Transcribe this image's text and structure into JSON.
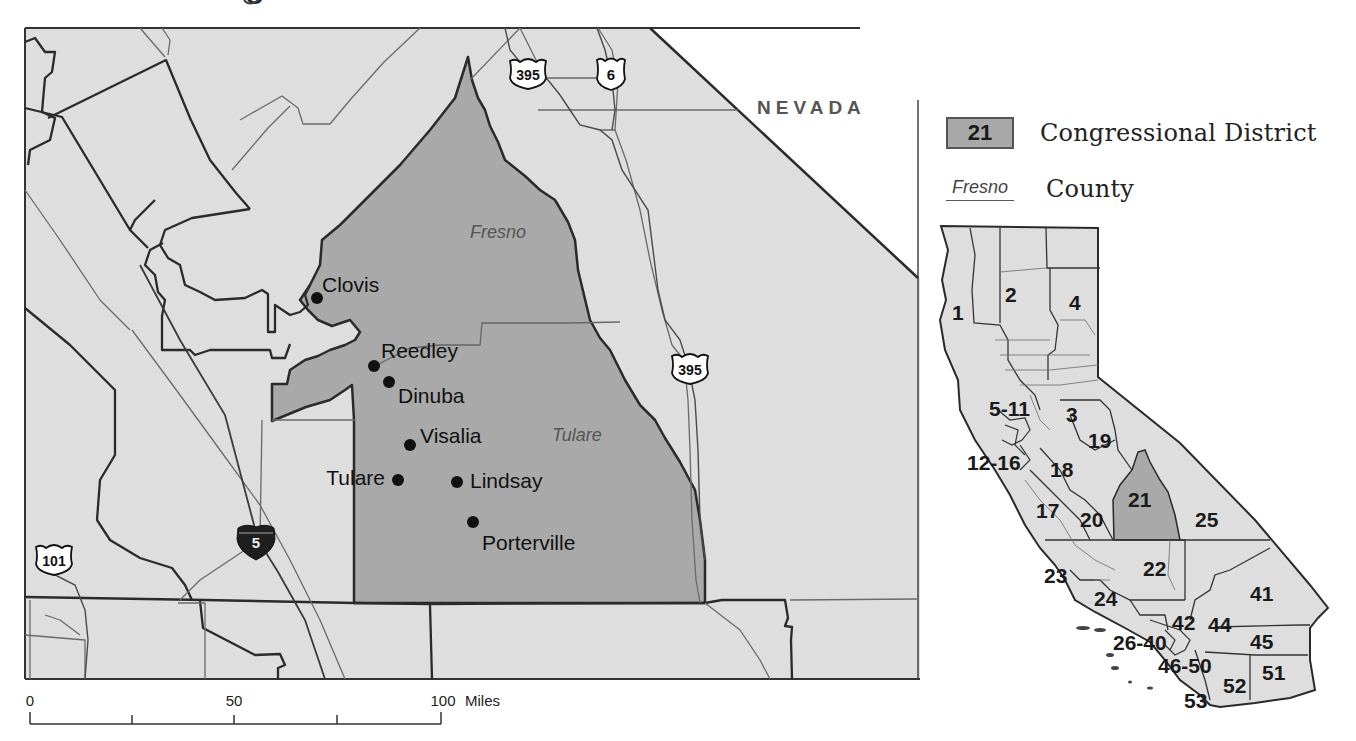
{
  "title_fragment": "g",
  "main_map": {
    "state_label": "NEVADA",
    "counties": [
      {
        "name": "Fresno",
        "label_pos": [
          500,
          232
        ]
      },
      {
        "name": "Tulare",
        "label_pos": [
          580,
          440
        ]
      }
    ],
    "cities": [
      {
        "name": "Clovis",
        "x": 317,
        "y": 298,
        "lx": 322,
        "ly": 292,
        "anchor": "start"
      },
      {
        "name": "Reedley",
        "x": 374,
        "y": 366,
        "lx": 381,
        "ly": 358,
        "anchor": "start"
      },
      {
        "name": "Dinuba",
        "x": 389,
        "y": 382,
        "lx": 398,
        "ly": 403,
        "anchor": "start"
      },
      {
        "name": "Visalia",
        "x": 410,
        "y": 445,
        "lx": 420,
        "ly": 443,
        "anchor": "start"
      },
      {
        "name": "Tulare",
        "x": 398,
        "y": 480,
        "lx": 385,
        "ly": 485,
        "anchor": "end"
      },
      {
        "name": "Lindsay",
        "x": 457,
        "y": 482,
        "lx": 470,
        "ly": 488,
        "anchor": "start"
      },
      {
        "name": "Porterville",
        "x": 473,
        "y": 522,
        "lx": 482,
        "ly": 550,
        "anchor": "start"
      }
    ],
    "highway_shields": [
      {
        "type": "us",
        "number": "395",
        "x": 528,
        "y": 74
      },
      {
        "type": "us",
        "number": "6",
        "x": 611,
        "y": 74
      },
      {
        "type": "us",
        "number": "395",
        "x": 690,
        "y": 369
      },
      {
        "type": "interstate",
        "number": "5",
        "x": 256,
        "y": 541
      },
      {
        "type": "us",
        "number": "101",
        "x": 54,
        "y": 560
      }
    ],
    "scale_bar": {
      "ticks": [
        "0",
        "50",
        "100"
      ],
      "unit": "Miles"
    }
  },
  "legend": {
    "district_number": "21",
    "district_label": "Congressional District",
    "county_sample": "Fresno",
    "county_label": "County"
  },
  "inset_map": {
    "highlighted_district": "21",
    "district_labels": [
      {
        "text": "1",
        "x": 958,
        "y": 318
      },
      {
        "text": "2",
        "x": 1012,
        "y": 302
      },
      {
        "text": "4",
        "x": 1076,
        "y": 310
      },
      {
        "text": "5-11",
        "x": 1010,
        "y": 416
      },
      {
        "text": "3",
        "x": 1073,
        "y": 420
      },
      {
        "text": "19",
        "x": 1100,
        "y": 448
      },
      {
        "text": "12-16",
        "x": 997,
        "y": 470
      },
      {
        "text": "18",
        "x": 1062,
        "y": 478
      },
      {
        "text": "21",
        "x": 1140,
        "y": 510
      },
      {
        "text": "17",
        "x": 1048,
        "y": 518
      },
      {
        "text": "20",
        "x": 1095,
        "y": 527
      },
      {
        "text": "25",
        "x": 1210,
        "y": 527
      },
      {
        "text": "22",
        "x": 1158,
        "y": 576
      },
      {
        "text": "23",
        "x": 1057,
        "y": 582
      },
      {
        "text": "24",
        "x": 1106,
        "y": 607
      },
      {
        "text": "41",
        "x": 1264,
        "y": 600
      },
      {
        "text": "42",
        "x": 1186,
        "y": 630
      },
      {
        "text": "44",
        "x": 1222,
        "y": 632
      },
      {
        "text": "45",
        "x": 1264,
        "y": 648
      },
      {
        "text": "26-40",
        "x": 1146,
        "y": 650
      },
      {
        "text": "46-50",
        "x": 1192,
        "y": 672
      },
      {
        "text": "51",
        "x": 1275,
        "y": 680
      },
      {
        "text": "52",
        "x": 1237,
        "y": 692
      },
      {
        "text": "53",
        "x": 1200,
        "y": 707
      }
    ]
  },
  "colors": {
    "background": "#ffffff",
    "land": "#dedede",
    "district_fill": "#a9a9a9",
    "boundary_dark": "#2a2a2a",
    "boundary_light": "#6a6a6a",
    "interstate_shield": "#1e1e1e"
  }
}
